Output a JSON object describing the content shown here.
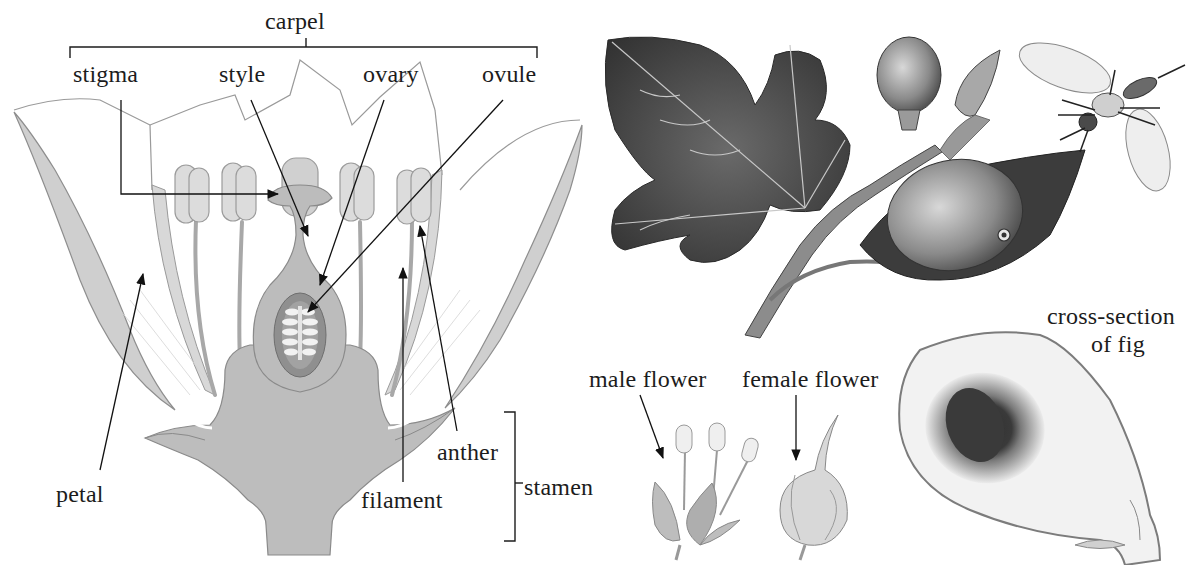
{
  "figure": {
    "caption_cutoff": "",
    "flower_section": {
      "group_labels": {
        "carpel": "carpel",
        "stamen": "stamen"
      },
      "part_labels": {
        "stigma": "stigma",
        "style": "style",
        "ovary": "ovary",
        "ovule": "ovule",
        "petal": "petal",
        "filament": "filament",
        "anther": "anther"
      }
    },
    "fig_plant": {
      "labels": {
        "male_flower": "male flower",
        "female_flower": "female flower",
        "cross_section_line1": "cross-section",
        "cross_section_line2": "of fig"
      },
      "illustrations": [
        "fig-branch",
        "fig-leaf",
        "fig-fruit",
        "fig-bud",
        "fig-wasp",
        "male-flower",
        "female-flower",
        "fig-cross-section"
      ]
    },
    "colors": {
      "ink": "#1c1c1c",
      "receptacle": "#bdbdbd",
      "ovary_wall": "#8f8f8f",
      "ovule": "#f2f2f2",
      "anther": "#d6d6d6",
      "leaf_dark": "#4a4a4a",
      "fig_flesh": "#777777"
    }
  }
}
